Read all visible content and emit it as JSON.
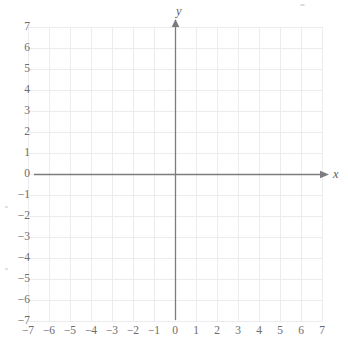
{
  "figure": {
    "kind": "blank-cartesian-coordinate-plane",
    "axis_label_x": "x",
    "axis_label_y": "y",
    "background_color": "#ffffff",
    "grid_color": "#ececed",
    "axis_color": "#7b7b80",
    "label_color": "#6b6b70"
  },
  "chart_data": {
    "type": "scatter",
    "title": "",
    "subtitle": "",
    "xlabel": "x",
    "ylabel": "y",
    "xlim": [
      -7,
      7
    ],
    "ylim": [
      -7,
      7
    ],
    "xticks": [
      -7,
      -6,
      -5,
      -4,
      -3,
      -2,
      -1,
      0,
      1,
      2,
      3,
      4,
      5,
      6,
      7
    ],
    "yticks": [
      -7,
      -6,
      -5,
      -4,
      -3,
      -2,
      -1,
      0,
      1,
      2,
      3,
      4,
      5,
      6,
      7
    ],
    "xtick_labels": [
      "−7",
      "−6",
      "−5",
      "−4",
      "−3",
      "−2",
      "−1",
      "0",
      "1",
      "2",
      "3",
      "4",
      "5",
      "6",
      "7"
    ],
    "ytick_labels": [
      "−7",
      "−6",
      "−5",
      "−4",
      "−3",
      "−2",
      "−1",
      "0",
      "1",
      "2",
      "3",
      "4",
      "5",
      "6",
      "7"
    ],
    "grid": true,
    "grid_step": 1,
    "legend": null,
    "legend_position": "none",
    "series": [],
    "annotations": [],
    "axis_arrows": [
      "x-positive",
      "y-positive"
    ],
    "note": "Empty grid; no data points, curves or shaded regions are plotted."
  },
  "geometry": {
    "origin_px": {
      "x": 175,
      "y": 174
    },
    "unit_px": 21,
    "grid_left_px": 34,
    "grid_right_px": 322,
    "grid_top_px": 25,
    "grid_bottom_px": 320
  }
}
